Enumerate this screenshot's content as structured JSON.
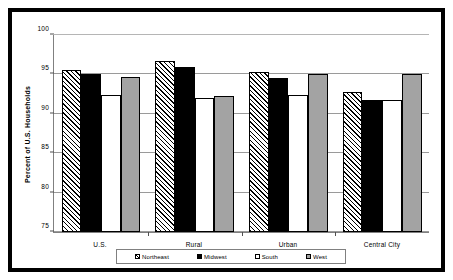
{
  "chart_data": {
    "type": "bar",
    "title": "",
    "xlabel": "",
    "ylabel": "Percent of U.S. Households",
    "ylim": [
      75,
      100
    ],
    "yticks": [
      75,
      80,
      85,
      90,
      95,
      100
    ],
    "grid": true,
    "legend_position": "bottom",
    "categories": [
      "U.S.",
      "Rural",
      "Urban",
      "Central City"
    ],
    "series": [
      {
        "name": "Northeast",
        "color": "#ffffff",
        "pattern": "diagonal-hatch",
        "values": [
          95.6,
          96.7,
          95.3,
          92.8
        ]
      },
      {
        "name": "Midwest",
        "color": "#000000",
        "pattern": "solid",
        "values": [
          95.0,
          96.0,
          94.5,
          91.7
        ]
      },
      {
        "name": "South",
        "color": "#ffffff",
        "pattern": "solid",
        "values": [
          92.4,
          92.0,
          92.4,
          91.8
        ]
      },
      {
        "name": "West",
        "color": "#a3a3a3",
        "pattern": "solid",
        "values": [
          94.7,
          92.3,
          95.0,
          95.1
        ]
      }
    ]
  },
  "legend": {
    "items": [
      {
        "label": "Northeast"
      },
      {
        "label": "Midwest"
      },
      {
        "label": "South"
      },
      {
        "label": "West"
      }
    ]
  }
}
